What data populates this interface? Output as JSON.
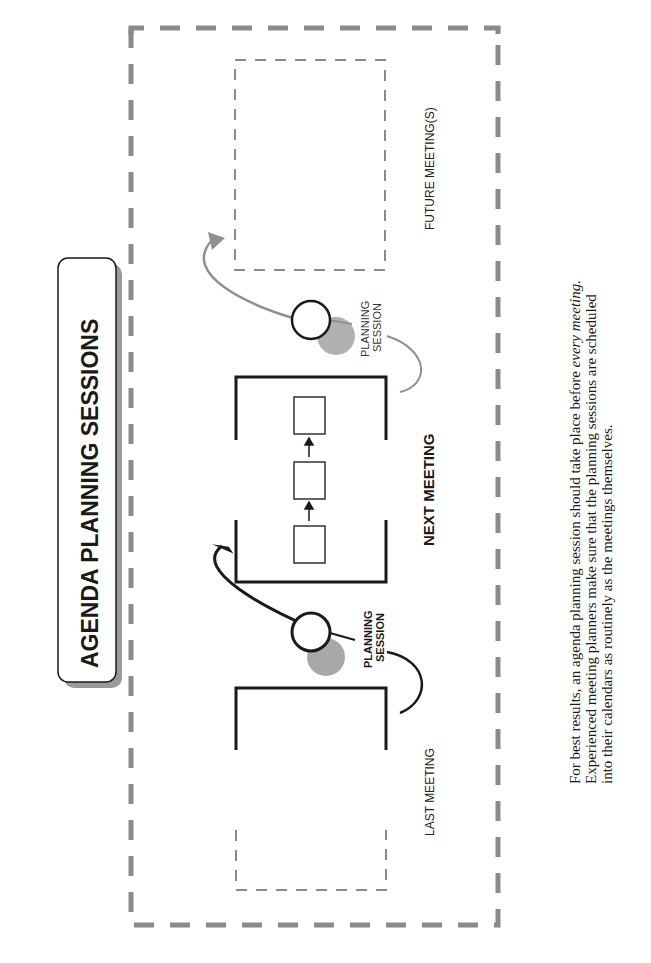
{
  "title": "AGENDA PLANNING SESSIONS",
  "stages": {
    "last_meeting": "LAST MEETING",
    "next_meeting": "NEXT MEETING",
    "future_meetings": "FUTURE MEETING(S)"
  },
  "planning_sessions": {
    "first": {
      "line1": "PLANNING",
      "line2": "SESSION"
    },
    "second": {
      "line1": "PLANNING",
      "line2": "SESSION"
    }
  },
  "caption": {
    "line1_prefix": "For best results, an agenda planning session should take place before ",
    "line1_italic": "every meeting.",
    "line2": "Experienced meeting planners make sure that the planning sessions are scheduled",
    "line3": "into their calendars as routinely as the meetings themselves."
  },
  "colors": {
    "ink": "#1a1a1a",
    "gray_dash": "#8a8a8a",
    "gray_shadow": "#a8a8a8",
    "gray_arrow": "#909090"
  }
}
